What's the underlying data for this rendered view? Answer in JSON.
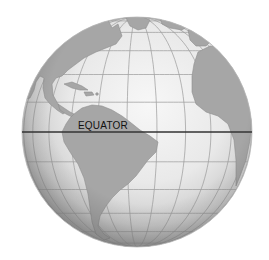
{
  "figure": {
    "label": "EQUATOR",
    "continents_visible": [
      "North America",
      "Caribbean islands",
      "South America",
      "Africa (western)",
      "Greenland (edge)"
    ],
    "colors": {
      "background": "#ffffff",
      "ocean_highlight": "#f4f4f4",
      "ocean_edge": "#a9a9a9",
      "land": "#a6a6a6",
      "land_outline": "#8e8e8e",
      "graticule": "#9a9a9a",
      "equator_line": "#333333"
    }
  }
}
